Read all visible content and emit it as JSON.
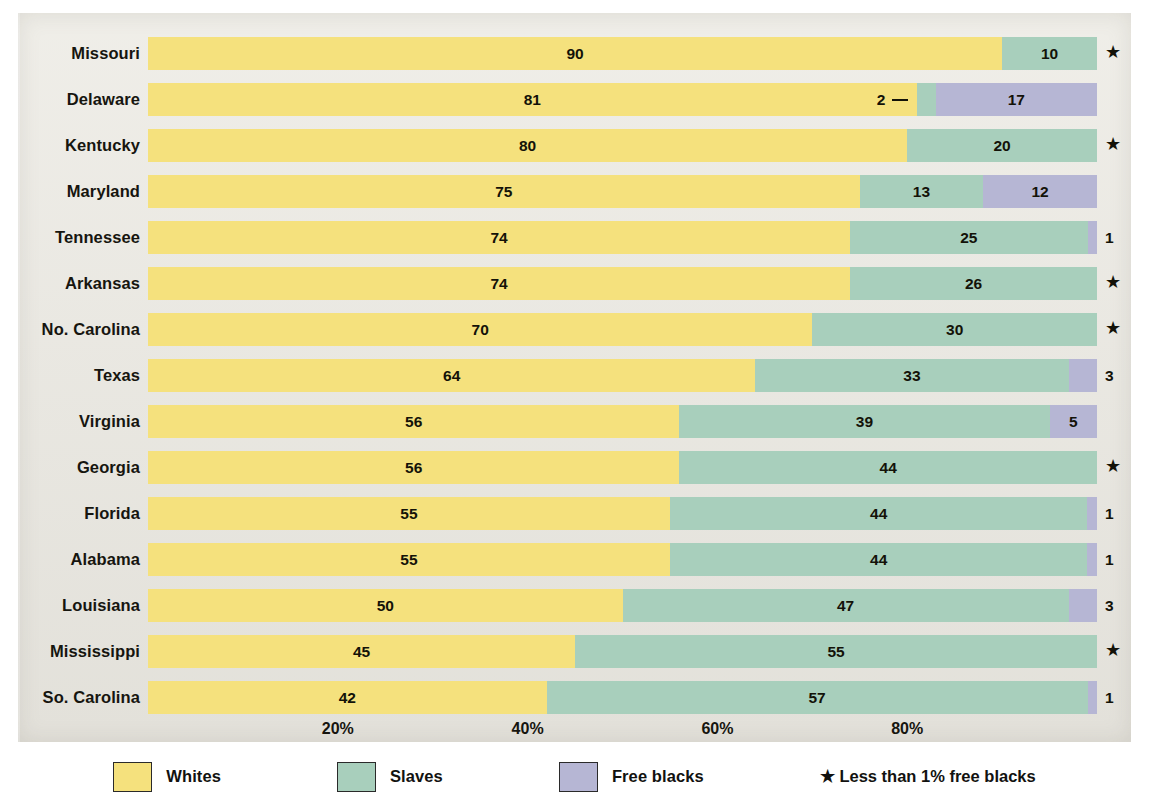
{
  "chart_data": {
    "type": "bar",
    "subtype": "stacked-horizontal-percent",
    "title": "",
    "xlabel": "",
    "ylabel": "",
    "xlim": [
      0,
      100
    ],
    "grid": false,
    "legend_position": "bottom",
    "categories": [
      "Missouri",
      "Delaware",
      "Kentucky",
      "Maryland",
      "Tennessee",
      "Arkansas",
      "No. Carolina",
      "Texas",
      "Virginia",
      "Georgia",
      "Florida",
      "Alabama",
      "Louisiana",
      "Mississippi",
      "So. Carolina"
    ],
    "series": [
      {
        "name": "Whites",
        "color": "#f5e17d",
        "values": [
          90,
          81,
          80,
          75,
          74,
          74,
          70,
          64,
          56,
          56,
          55,
          55,
          50,
          45,
          42
        ]
      },
      {
        "name": "Slaves",
        "color": "#a8cfbc",
        "values": [
          10,
          2,
          20,
          13,
          25,
          26,
          30,
          33,
          39,
          44,
          44,
          44,
          47,
          55,
          57
        ]
      },
      {
        "name": "Free blacks",
        "color": "#b6b6d4",
        "values": [
          0,
          17,
          0,
          12,
          1,
          0,
          0,
          3,
          5,
          0,
          1,
          1,
          3,
          0,
          1
        ]
      }
    ],
    "x_ticks": [
      {
        "value": 20,
        "label": "20%"
      },
      {
        "value": 40,
        "label": "40%"
      },
      {
        "value": 60,
        "label": "60%"
      },
      {
        "value": 80,
        "label": "80%"
      }
    ],
    "rows": [
      {
        "state": "Missouri",
        "whites": 90,
        "slaves": 10,
        "free_blacks": 0,
        "whites_label": "90",
        "slaves_label": "10",
        "free_label": "",
        "star": true,
        "callout": false
      },
      {
        "state": "Delaware",
        "whites": 81,
        "slaves": 2,
        "free_blacks": 17,
        "whites_label": "81",
        "slaves_label": "2",
        "free_label": "17",
        "star": false,
        "callout": true
      },
      {
        "state": "Kentucky",
        "whites": 80,
        "slaves": 20,
        "free_blacks": 0,
        "whites_label": "80",
        "slaves_label": "20",
        "free_label": "",
        "star": true,
        "callout": false
      },
      {
        "state": "Maryland",
        "whites": 75,
        "slaves": 13,
        "free_blacks": 12,
        "whites_label": "75",
        "slaves_label": "13",
        "free_label": "12",
        "star": false,
        "callout": false
      },
      {
        "state": "Tennessee",
        "whites": 74,
        "slaves": 25,
        "free_blacks": 1,
        "whites_label": "74",
        "slaves_label": "25",
        "free_label": "1",
        "star": false,
        "callout": false
      },
      {
        "state": "Arkansas",
        "whites": 74,
        "slaves": 26,
        "free_blacks": 0,
        "whites_label": "74",
        "slaves_label": "26",
        "free_label": "",
        "star": true,
        "callout": false
      },
      {
        "state": "No. Carolina",
        "whites": 70,
        "slaves": 30,
        "free_blacks": 0,
        "whites_label": "70",
        "slaves_label": "30",
        "free_label": "",
        "star": true,
        "callout": false
      },
      {
        "state": "Texas",
        "whites": 64,
        "slaves": 33,
        "free_blacks": 3,
        "whites_label": "64",
        "slaves_label": "33",
        "free_label": "3",
        "star": false,
        "callout": false
      },
      {
        "state": "Virginia",
        "whites": 56,
        "slaves": 39,
        "free_blacks": 5,
        "whites_label": "56",
        "slaves_label": "39",
        "free_label": "5",
        "star": false,
        "callout": false
      },
      {
        "state": "Georgia",
        "whites": 56,
        "slaves": 44,
        "free_blacks": 0,
        "whites_label": "56",
        "slaves_label": "44",
        "free_label": "",
        "star": true,
        "callout": false
      },
      {
        "state": "Florida",
        "whites": 55,
        "slaves": 44,
        "free_blacks": 1,
        "whites_label": "55",
        "slaves_label": "44",
        "free_label": "1",
        "star": false,
        "callout": false
      },
      {
        "state": "Alabama",
        "whites": 55,
        "slaves": 44,
        "free_blacks": 1,
        "whites_label": "55",
        "slaves_label": "44",
        "free_label": "1",
        "star": false,
        "callout": false
      },
      {
        "state": "Louisiana",
        "whites": 50,
        "slaves": 47,
        "free_blacks": 3,
        "whites_label": "50",
        "slaves_label": "47",
        "free_label": "3",
        "star": false,
        "callout": false
      },
      {
        "state": "Mississippi",
        "whites": 45,
        "slaves": 55,
        "free_blacks": 0,
        "whites_label": "45",
        "slaves_label": "55",
        "free_label": "",
        "star": true,
        "callout": false
      },
      {
        "state": "So. Carolina",
        "whites": 42,
        "slaves": 57,
        "free_blacks": 1,
        "whites_label": "42",
        "slaves_label": "57",
        "free_label": "1",
        "star": false,
        "callout": false
      }
    ]
  },
  "legend": {
    "items": [
      {
        "label": "Whites",
        "color": "#f5e17d"
      },
      {
        "label": "Slaves",
        "color": "#a8cfbc"
      },
      {
        "label": "Free blacks",
        "color": "#b6b6d4"
      }
    ],
    "note": "★ Less than 1% free blacks",
    "star_glyph": "★"
  }
}
